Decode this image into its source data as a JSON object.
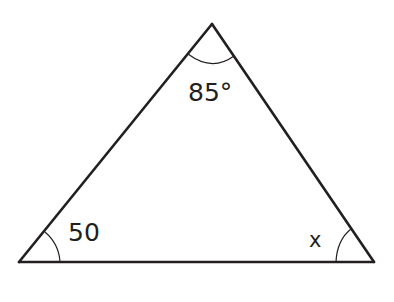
{
  "diagram": {
    "type": "triangle",
    "colors": {
      "stroke": "#231f20",
      "background": "#ffffff"
    },
    "vertices": {
      "apex": {
        "x": 212,
        "y": 24
      },
      "bottom_left": {
        "x": 19,
        "y": 262
      },
      "bottom_right": {
        "x": 374,
        "y": 262
      }
    },
    "angles": {
      "apex": {
        "label": "85°",
        "value": 85,
        "unit": "degrees"
      },
      "bottom_left": {
        "label": "50",
        "value": 50
      },
      "bottom_right": {
        "label": "x",
        "value": null,
        "unknown": true
      }
    }
  }
}
